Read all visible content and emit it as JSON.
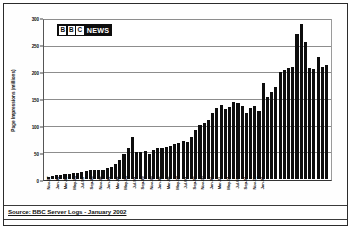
{
  "figure": {
    "logo": {
      "b1": "B",
      "b2": "B",
      "b3": "C",
      "news": "NEWS"
    },
    "source": "Source: BBC Server Logs - January 2002"
  },
  "chart_data": {
    "type": "bar",
    "title": "",
    "xlabel": "",
    "ylabel": "Page Impressions (millions)",
    "ylim": [
      0,
      300
    ],
    "yticks": [
      0,
      50,
      100,
      150,
      200,
      250,
      300
    ],
    "ytick_labels": [
      "0",
      "50",
      "100",
      "150",
      "200",
      "250",
      "300"
    ],
    "grid": true,
    "legend": false,
    "bar_color": "#0d0d0d",
    "categories": [
      "Nov-97",
      "Dec-97",
      "Jan-98",
      "Feb-98",
      "Mar-98",
      "Apr-98",
      "May-98",
      "Jun-98",
      "Jul-98",
      "Aug-98",
      "Sep-98",
      "Oct-98",
      "Nov-98",
      "Dec-98",
      "Jan-99",
      "Feb-99",
      "Mar-99",
      "Apr-99",
      "May-99",
      "Jun-99",
      "Jul-99",
      "Aug-99",
      "Sep-99",
      "Oct-99",
      "Nov-99",
      "Dec-99",
      "Jan-00",
      "Feb-00",
      "Mar-00",
      "Apr-00",
      "May-00",
      "Jun-00",
      "Jul-00",
      "Aug-00",
      "Sep-00",
      "Oct-00",
      "Nov-00",
      "Dec-00",
      "Jan-01",
      "Feb-01",
      "Mar-01",
      "Apr-01",
      "May-01",
      "Jun-01",
      "Jul-01",
      "Aug-01",
      "Sep-01",
      "Oct-01",
      "Nov-01",
      "Dec-01",
      "Jan-02"
    ],
    "xtick_labels": [
      "Nov-97",
      "Jan-98",
      "Mar-98",
      "May-98",
      "Jul-98",
      "Sep-98",
      "Nov-98",
      "Jan-99",
      "Mar-99",
      "May-99",
      "Jul-99",
      "Sep-99",
      "Nov-99",
      "Jan-00",
      "Mar-00",
      "May-00",
      "Jul-00",
      "Sep-00",
      "Nov-00",
      "Jan-01",
      "Mar-01",
      "May-01",
      "Jul-01",
      "Sep-01",
      "Nov-01",
      "Jan-02"
    ],
    "values": [
      4,
      5,
      7,
      8,
      9,
      9,
      11,
      12,
      14,
      15,
      18,
      18,
      18,
      18,
      21,
      22,
      28,
      37,
      47,
      59,
      80,
      52,
      52,
      53,
      48,
      55,
      59,
      58,
      60,
      62,
      66,
      69,
      73,
      71,
      79,
      93,
      103,
      107,
      112,
      126,
      134,
      141,
      132,
      136,
      147,
      145,
      138,
      126,
      134,
      138,
      130
    ],
    "values_tail": [
      182,
      155,
      165,
      174,
      203,
      207,
      211,
      213,
      276,
      295,
      260,
      211,
      208,
      232,
      212,
      217
    ]
  }
}
